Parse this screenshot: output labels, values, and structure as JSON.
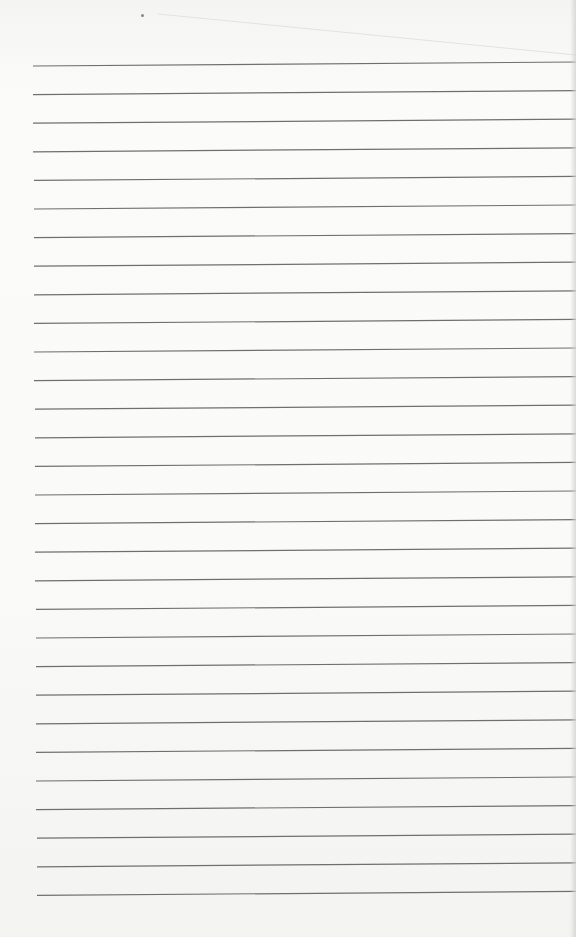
{
  "page": {
    "type": "lined-paper",
    "background_color": "#f9f9f8",
    "line_color": "#6f6f6f",
    "line_count": 30,
    "first_line_y": 66,
    "line_spacing": 28.6,
    "line_start_x": 33,
    "line_end_x": 576,
    "tilt_px": -4,
    "hole_mark": {
      "x": 142,
      "y": 15
    }
  }
}
